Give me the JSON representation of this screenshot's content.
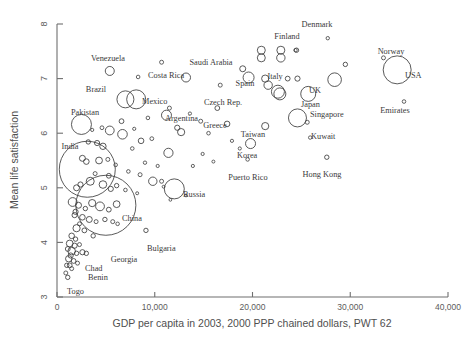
{
  "chart_data": {
    "type": "scatter",
    "title": "",
    "xlabel": "GDP per capita in 2003, 2000 PPP chained dollars, PWT 62",
    "ylabel": "Mean life satisfaction",
    "xlim": [
      0,
      40000
    ],
    "ylim": [
      3,
      8
    ],
    "grid": false,
    "legend": null,
    "size_encoding": "population",
    "xticks": [
      {
        "value": 0,
        "label": "0"
      },
      {
        "value": 10000,
        "label": "10,000"
      },
      {
        "value": 20000,
        "label": "20,000"
      },
      {
        "value": 30000,
        "label": "30,000"
      },
      {
        "value": 40000,
        "label": "40,000"
      }
    ],
    "yticks": [
      {
        "value": 3,
        "label": "3"
      },
      {
        "value": 4,
        "label": "4"
      },
      {
        "value": 5,
        "label": "5"
      },
      {
        "value": 6,
        "label": "6"
      },
      {
        "value": 7,
        "label": "7"
      },
      {
        "value": 8,
        "label": "8"
      }
    ],
    "points": [
      {
        "name": "Venezuela",
        "x": 5400,
        "y": 7.14,
        "r": 4.5,
        "label": "Venezuela",
        "lx": 108,
        "ly": 61,
        "anchor": "middle"
      },
      {
        "name": "Costa Rica",
        "x": 8300,
        "y": 7.03,
        "r": 1.8,
        "label": "Costa Rica",
        "lx": 148,
        "ly": 78,
        "anchor": "start"
      },
      {
        "name": "Brazil",
        "x": 7000,
        "y": 6.62,
        "r": 8.5,
        "label": "Brazil",
        "lx": 96,
        "ly": 92,
        "anchor": "middle"
      },
      {
        "name": "Mexico",
        "x": 8100,
        "y": 6.62,
        "r": 9.5,
        "label": "Mexico",
        "lx": 142,
        "ly": 104,
        "anchor": "start"
      },
      {
        "name": "Saudi Arabia",
        "x": 13200,
        "y": 7.02,
        "r": 4.5,
        "label": "Saudi Arabia",
        "lx": 211,
        "ly": 65,
        "anchor": "middle"
      },
      {
        "name": "Spain",
        "x": 19600,
        "y": 7.02,
        "r": 5.5,
        "label": "Spain",
        "lx": 245,
        "ly": 86,
        "anchor": "middle"
      },
      {
        "name": "Italy",
        "x": 22600,
        "y": 6.76,
        "r": 6.5,
        "label": "Italy",
        "lx": 275,
        "ly": 79,
        "anchor": "middle"
      },
      {
        "name": "Denmark",
        "x": 27700,
        "y": 7.74,
        "r": 1.7,
        "label": "Denmark",
        "lx": 317,
        "ly": 27,
        "anchor": "middle"
      },
      {
        "name": "Finland",
        "x": 24400,
        "y": 7.52,
        "r": 1.7,
        "label": "Finland",
        "lx": 287,
        "ly": 39,
        "anchor": "middle"
      },
      {
        "name": "Norway",
        "x": 33400,
        "y": 7.38,
        "r": 2.0,
        "label": "Norway",
        "lx": 391,
        "ly": 54,
        "anchor": "middle"
      },
      {
        "name": "USA",
        "x": 34800,
        "y": 7.16,
        "r": 14.0,
        "label": "USA",
        "lx": 405,
        "ly": 78,
        "anchor": "start"
      },
      {
        "name": "Emirates",
        "x": 35500,
        "y": 6.58,
        "r": 1.8,
        "label": "Emirates",
        "lx": 395,
        "ly": 113,
        "anchor": "middle"
      },
      {
        "name": "UK",
        "x": 25700,
        "y": 6.72,
        "r": 7.5,
        "label": "UK",
        "lx": 309,
        "ly": 93,
        "anchor": "start"
      },
      {
        "name": "Japan",
        "x": 24600,
        "y": 6.28,
        "r": 9.0,
        "label": "Japan",
        "lx": 301,
        "ly": 107,
        "anchor": "start"
      },
      {
        "name": "Singapore",
        "x": 25600,
        "y": 6.2,
        "r": 2.0,
        "label": "Singapore",
        "lx": 310,
        "ly": 117,
        "anchor": "start"
      },
      {
        "name": "Czech Rep.",
        "x": 16400,
        "y": 6.46,
        "r": 2.4,
        "label": "Czech Rep.",
        "lx": 223,
        "ly": 105,
        "anchor": "middle"
      },
      {
        "name": "Argentina",
        "x": 11200,
        "y": 6.33,
        "r": 5.0,
        "label": "Argentina",
        "lx": 165,
        "ly": 121,
        "anchor": "start"
      },
      {
        "name": "Greece",
        "x": 17400,
        "y": 6.17,
        "r": 2.8,
        "label": "Greece",
        "lx": 215,
        "ly": 128,
        "anchor": "middle"
      },
      {
        "name": "Taiwan",
        "x": 21300,
        "y": 6.13,
        "r": 3.6,
        "label": "Taiwan",
        "lx": 253,
        "ly": 137,
        "anchor": "middle"
      },
      {
        "name": "Korea",
        "x": 19800,
        "y": 5.81,
        "r": 5.0,
        "label": "Korea",
        "lx": 237,
        "ly": 158,
        "anchor": "start"
      },
      {
        "name": "Puerto Rico",
        "x": 19500,
        "y": 5.52,
        "r": 1.8,
        "label": "Puerto Rico",
        "lx": 248,
        "ly": 180,
        "anchor": "middle"
      },
      {
        "name": "Kuwait",
        "x": 25900,
        "y": 5.92,
        "r": 1.7,
        "label": "Kuwait",
        "lx": 311,
        "ly": 139,
        "anchor": "start"
      },
      {
        "name": "Hong Kong",
        "x": 27600,
        "y": 5.56,
        "r": 2.2,
        "label": "Hong Kong",
        "lx": 322,
        "ly": 177,
        "anchor": "middle"
      },
      {
        "name": "Pakistan",
        "x": 2500,
        "y": 6.16,
        "r": 10.0,
        "label": "Pakistan",
        "lx": 85,
        "ly": 115,
        "anchor": "middle"
      },
      {
        "name": "India",
        "x": 3100,
        "y": 5.34,
        "r": 28.0,
        "label": "India",
        "lx": 70,
        "ly": 149,
        "anchor": "middle"
      },
      {
        "name": "China",
        "x": 5000,
        "y": 4.68,
        "r": 30.0,
        "label": "China",
        "lx": 122,
        "ly": 221,
        "anchor": "start"
      },
      {
        "name": "Russia",
        "x": 12000,
        "y": 4.98,
        "r": 10.0,
        "label": "Russia",
        "lx": 183,
        "ly": 197,
        "anchor": "start"
      },
      {
        "name": "Bulgaria",
        "x": 9100,
        "y": 4.22,
        "r": 2.2,
        "label": "Bulgaria",
        "lx": 147,
        "ly": 251,
        "anchor": "start"
      },
      {
        "name": "Georgia",
        "x": 3700,
        "y": 4.12,
        "r": 2.2,
        "label": "Georgia",
        "lx": 124,
        "ly": 262,
        "anchor": "middle"
      },
      {
        "name": "Chad",
        "x": 1400,
        "y": 3.76,
        "r": 2.6,
        "label": "Chad",
        "lx": 85,
        "ly": 271,
        "anchor": "start"
      },
      {
        "name": "Benin",
        "x": 1300,
        "y": 3.58,
        "r": 2.4,
        "label": "Benin",
        "lx": 88,
        "ly": 280,
        "anchor": "start"
      },
      {
        "name": "Togo",
        "x": 1100,
        "y": 3.36,
        "r": 2.2,
        "label": "Togo",
        "lx": 67,
        "ly": 294,
        "anchor": "start"
      }
    ],
    "unlabeled_points": [
      {
        "x": 10700,
        "y": 7.3,
        "r": 2.0
      },
      {
        "x": 20900,
        "y": 7.52,
        "r": 4.0
      },
      {
        "x": 20900,
        "y": 7.38,
        "r": 4.0
      },
      {
        "x": 22900,
        "y": 7.52,
        "r": 4.0
      },
      {
        "x": 22900,
        "y": 7.38,
        "r": 4.2
      },
      {
        "x": 24500,
        "y": 7.52,
        "r": 2.2
      },
      {
        "x": 19000,
        "y": 7.18,
        "r": 3.0
      },
      {
        "x": 21300,
        "y": 7.0,
        "r": 3.6
      },
      {
        "x": 21600,
        "y": 6.88,
        "r": 4.2
      },
      {
        "x": 23600,
        "y": 7.0,
        "r": 2.4
      },
      {
        "x": 24600,
        "y": 7.0,
        "r": 2.6
      },
      {
        "x": 22800,
        "y": 6.72,
        "r": 6.0
      },
      {
        "x": 28400,
        "y": 6.98,
        "r": 6.8
      },
      {
        "x": 16700,
        "y": 6.88,
        "r": 2.0
      },
      {
        "x": 29500,
        "y": 7.26,
        "r": 2.2
      },
      {
        "x": 14700,
        "y": 6.22,
        "r": 2.0
      },
      {
        "x": 12300,
        "y": 6.1,
        "r": 2.6
      },
      {
        "x": 12700,
        "y": 6.02,
        "r": 3.6
      },
      {
        "x": 9300,
        "y": 6.28,
        "r": 1.8
      },
      {
        "x": 6600,
        "y": 6.22,
        "r": 2.4
      },
      {
        "x": 5400,
        "y": 6.05,
        "r": 4.4
      },
      {
        "x": 6700,
        "y": 5.98,
        "r": 4.8
      },
      {
        "x": 4600,
        "y": 6.1,
        "r": 1.9
      },
      {
        "x": 3600,
        "y": 6.06,
        "r": 1.6
      },
      {
        "x": 8600,
        "y": 5.86,
        "r": 2.8
      },
      {
        "x": 9700,
        "y": 5.9,
        "r": 1.9
      },
      {
        "x": 7700,
        "y": 5.72,
        "r": 1.8
      },
      {
        "x": 4100,
        "y": 5.82,
        "r": 2.6
      },
      {
        "x": 4700,
        "y": 5.76,
        "r": 3.2
      },
      {
        "x": 3200,
        "y": 5.84,
        "r": 2.2
      },
      {
        "x": 11400,
        "y": 5.64,
        "r": 4.6
      },
      {
        "x": 9000,
        "y": 5.46,
        "r": 1.7
      },
      {
        "x": 10300,
        "y": 5.4,
        "r": 1.6
      },
      {
        "x": 13900,
        "y": 5.4,
        "r": 1.6
      },
      {
        "x": 2600,
        "y": 5.54,
        "r": 3.0
      },
      {
        "x": 3000,
        "y": 5.48,
        "r": 2.8
      },
      {
        "x": 4300,
        "y": 5.5,
        "r": 3.4
      },
      {
        "x": 5200,
        "y": 5.52,
        "r": 2.0
      },
      {
        "x": 6000,
        "y": 5.42,
        "r": 1.8
      },
      {
        "x": 9800,
        "y": 5.12,
        "r": 4.2
      },
      {
        "x": 10700,
        "y": 5.12,
        "r": 2.0
      },
      {
        "x": 2000,
        "y": 5.0,
        "r": 3.0
      },
      {
        "x": 2400,
        "y": 5.06,
        "r": 2.6
      },
      {
        "x": 3400,
        "y": 5.12,
        "r": 4.0
      },
      {
        "x": 4700,
        "y": 5.06,
        "r": 3.8
      },
      {
        "x": 5500,
        "y": 4.98,
        "r": 2.6
      },
      {
        "x": 6100,
        "y": 5.04,
        "r": 2.2
      },
      {
        "x": 7000,
        "y": 4.96,
        "r": 1.8
      },
      {
        "x": 8200,
        "y": 4.9,
        "r": 1.5
      },
      {
        "x": 11600,
        "y": 4.78,
        "r": 1.4
      },
      {
        "x": 13200,
        "y": 4.86,
        "r": 1.4
      },
      {
        "x": 1600,
        "y": 4.74,
        "r": 4.4
      },
      {
        "x": 2200,
        "y": 4.68,
        "r": 3.0
      },
      {
        "x": 2900,
        "y": 4.62,
        "r": 2.2
      },
      {
        "x": 3600,
        "y": 4.72,
        "r": 3.6
      },
      {
        "x": 4400,
        "y": 4.66,
        "r": 4.4
      },
      {
        "x": 5300,
        "y": 4.6,
        "r": 2.4
      },
      {
        "x": 6100,
        "y": 4.7,
        "r": 3.4
      },
      {
        "x": 1800,
        "y": 4.5,
        "r": 2.6
      },
      {
        "x": 2600,
        "y": 4.46,
        "r": 2.8
      },
      {
        "x": 3300,
        "y": 4.42,
        "r": 3.0
      },
      {
        "x": 4000,
        "y": 4.38,
        "r": 2.0
      },
      {
        "x": 4900,
        "y": 4.42,
        "r": 2.2
      },
      {
        "x": 2000,
        "y": 4.26,
        "r": 3.6
      },
      {
        "x": 2800,
        "y": 4.22,
        "r": 2.4
      },
      {
        "x": 1500,
        "y": 4.12,
        "r": 2.8
      },
      {
        "x": 1900,
        "y": 4.06,
        "r": 2.2
      },
      {
        "x": 1300,
        "y": 3.98,
        "r": 3.4
      },
      {
        "x": 1800,
        "y": 3.94,
        "r": 2.6
      },
      {
        "x": 2300,
        "y": 3.96,
        "r": 2.0
      },
      {
        "x": 1100,
        "y": 3.88,
        "r": 2.4
      },
      {
        "x": 1500,
        "y": 3.84,
        "r": 3.8
      },
      {
        "x": 2000,
        "y": 3.8,
        "r": 2.2
      },
      {
        "x": 2600,
        "y": 3.82,
        "r": 2.6
      },
      {
        "x": 3000,
        "y": 3.8,
        "r": 2.2
      },
      {
        "x": 1200,
        "y": 3.7,
        "r": 3.2
      },
      {
        "x": 1700,
        "y": 3.66,
        "r": 2.4
      },
      {
        "x": 2100,
        "y": 3.62,
        "r": 2.0
      },
      {
        "x": 1000,
        "y": 3.58,
        "r": 2.2
      },
      {
        "x": 1500,
        "y": 3.52,
        "r": 2.0
      },
      {
        "x": 900,
        "y": 3.44,
        "r": 2.0
      },
      {
        "x": 1900,
        "y": 4.56,
        "r": 2.6
      },
      {
        "x": 2300,
        "y": 4.34,
        "r": 2.0
      },
      {
        "x": 5700,
        "y": 4.38,
        "r": 2.0
      },
      {
        "x": 6200,
        "y": 4.34,
        "r": 1.8
      },
      {
        "x": 3900,
        "y": 5.26,
        "r": 2.0
      },
      {
        "x": 5300,
        "y": 5.22,
        "r": 2.4
      },
      {
        "x": 7300,
        "y": 5.3,
        "r": 1.8
      },
      {
        "x": 8500,
        "y": 5.24,
        "r": 2.0
      },
      {
        "x": 14900,
        "y": 5.62,
        "r": 1.6
      },
      {
        "x": 16000,
        "y": 5.48,
        "r": 1.5
      },
      {
        "x": 10900,
        "y": 5.02,
        "r": 1.4
      },
      {
        "x": 7900,
        "y": 6.08,
        "r": 1.6
      },
      {
        "x": 11500,
        "y": 6.46,
        "r": 2.0
      },
      {
        "x": 13600,
        "y": 6.36,
        "r": 1.6
      },
      {
        "x": 15500,
        "y": 6.0,
        "r": 1.8
      },
      {
        "x": 17900,
        "y": 5.86,
        "r": 1.6
      },
      {
        "x": 18700,
        "y": 5.72,
        "r": 1.6
      }
    ]
  }
}
